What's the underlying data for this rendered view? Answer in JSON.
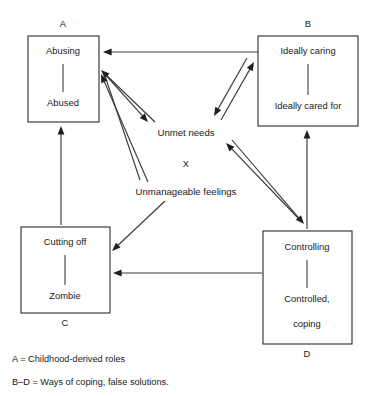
{
  "diagram": {
    "title_visible": false,
    "background_color": "#ffffff",
    "line_color": "#3a3a3a",
    "box_border_color": "#2b2b2b",
    "text_color": "#1a1a1a",
    "boxes": [
      {
        "id": "A",
        "letter": "A",
        "letter_position": "above",
        "top_label": "Abusing",
        "bottom_label": "Abused",
        "x": 28,
        "y": 36,
        "w": 71,
        "h": 86,
        "letter_x": 63,
        "letter_y": 25,
        "top_label_x": 63,
        "top_label_y": 52,
        "bottom_label_x": 63,
        "bottom_label_y": 104,
        "divider_x": 63,
        "divider_y1": 64,
        "divider_y2": 92,
        "accent_edge": null
      },
      {
        "id": "B",
        "letter": "B",
        "letter_position": "above",
        "top_label": "Ideally caring",
        "bottom_label": "Ideally cared for",
        "x": 258,
        "y": 36,
        "w": 100,
        "h": 90,
        "letter_x": 308,
        "letter_y": 25,
        "top_label_x": 308,
        "top_label_y": 52,
        "bottom_label_x": 308,
        "bottom_label_y": 107,
        "divider_x": 308,
        "divider_y1": 64,
        "divider_y2": 95,
        "accent_edge": null
      },
      {
        "id": "C",
        "letter": "C",
        "letter_position": "below",
        "top_label": "Cutting off",
        "bottom_label": "Zombie",
        "x": 21,
        "y": 227,
        "w": 89,
        "h": 86,
        "letter_x": 65,
        "letter_y": 324,
        "top_label_x": 65,
        "top_label_y": 243,
        "bottom_label_x": 65,
        "bottom_label_y": 297,
        "divider_x": 65,
        "divider_y1": 255,
        "divider_y2": 285,
        "accent_edge": null
      },
      {
        "id": "D",
        "letter": "D",
        "letter_position": "below",
        "top_label": "Controlling",
        "bottom_label": "Controlled,",
        "extra_label": "coping",
        "x": 263,
        "y": 231,
        "w": 89,
        "h": 113,
        "letter_x": 307,
        "letter_y": 355,
        "top_label_x": 307,
        "top_label_y": 248,
        "bottom_label_x": 307,
        "bottom_label_y": 300,
        "extra_label_x": 307,
        "extra_label_y": 325,
        "divider_x": 307,
        "divider_y1": 260,
        "divider_y2": 288,
        "accent_edge": {
          "edge": "bottom",
          "gradient_from": "#3cbf3c",
          "gradient_mid": "#e8e0c8",
          "gradient_to": "#e8336e"
        }
      }
    ],
    "center_labels": [
      {
        "id": "unmet-needs",
        "text": "Unmet needs",
        "x": 186,
        "y": 133
      },
      {
        "id": "x-marker",
        "text": "X",
        "x": 186,
        "y": 165
      },
      {
        "id": "unmanageable-feelings",
        "text": "Unmanageable feelings",
        "x": 186,
        "y": 192
      }
    ],
    "edges": [
      {
        "id": "b-to-a",
        "from": "B",
        "to": "A",
        "x1": 258,
        "y1": 52,
        "x2": 103,
        "y2": 52,
        "heads": "end"
      },
      {
        "id": "a-unmet-out",
        "from": "A",
        "to": "unmet-needs",
        "x1": 103,
        "y1": 72,
        "x2": 148,
        "y2": 122,
        "heads": "end"
      },
      {
        "id": "a-unmet-in",
        "from": "unmet-needs",
        "to": "A",
        "x1": 155,
        "y1": 122,
        "x2": 101,
        "y2": 70,
        "heads": "end"
      },
      {
        "id": "a-unmanage-out",
        "from": "A",
        "to": "unmanageable-feelings",
        "x1": 105,
        "y1": 76,
        "x2": 140,
        "y2": 180
      },
      {
        "id": "a-unmanage-in",
        "from": "unmanageable-feelings",
        "to": "A",
        "x1": 148,
        "y1": 182,
        "x2": 101,
        "y2": 74,
        "heads": "end"
      },
      {
        "id": "b-unmet-out",
        "from": "B",
        "to": "unmet-needs",
        "x1": 247,
        "y1": 58,
        "x2": 214,
        "y2": 116,
        "heads": "end"
      },
      {
        "id": "b-unmet-in",
        "from": "unmet-needs",
        "to": "B",
        "x1": 221,
        "y1": 120,
        "x2": 254,
        "y2": 62,
        "heads": "end"
      },
      {
        "id": "d-unmet-out",
        "from": "D",
        "to": "unmet-needs",
        "x1": 298,
        "y1": 218,
        "x2": 226,
        "y2": 143,
        "heads": "end"
      },
      {
        "id": "d-unmet-in",
        "from": "unmet-needs",
        "to": "D",
        "x1": 232,
        "y1": 140,
        "x2": 304,
        "y2": 224,
        "heads": "end"
      },
      {
        "id": "unmanage-to-c",
        "from": "unmanageable-feelings",
        "to": "C",
        "x1": 165,
        "y1": 201,
        "x2": 112,
        "y2": 251,
        "heads": "end"
      },
      {
        "id": "c-to-a",
        "from": "C",
        "to": "A",
        "x1": 61,
        "y1": 225,
        "x2": 61,
        "y2": 126,
        "heads": "end"
      },
      {
        "id": "d-to-b",
        "from": "D",
        "to": "B",
        "x1": 307,
        "y1": 229,
        "x2": 307,
        "y2": 130,
        "heads": "end"
      },
      {
        "id": "d-to-c",
        "from": "D",
        "to": "C",
        "x1": 262,
        "y1": 273,
        "x2": 113,
        "y2": 273,
        "heads": "end"
      }
    ],
    "legend": [
      {
        "id": "legend-a",
        "text": "A = Childhood-derived roles",
        "x": 12,
        "y": 360
      },
      {
        "id": "legend-bd",
        "text": "B–D = Ways of coping, false solutions.",
        "x": 12,
        "y": 383
      }
    ]
  }
}
